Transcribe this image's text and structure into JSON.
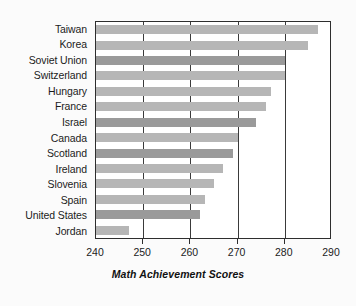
{
  "chart_data": {
    "type": "bar",
    "orientation": "horizontal",
    "title": "",
    "xlabel": "Math Achievement Scores",
    "ylabel": "",
    "xlim": [
      240,
      290
    ],
    "xticks": [
      240,
      250,
      260,
      270,
      280,
      290
    ],
    "xticklabels": [
      "240",
      "250",
      "260",
      "270",
      "280",
      "290"
    ],
    "grid": "vertical",
    "legend": "none",
    "categories": [
      "Taiwan",
      "Korea",
      "Soviet Union",
      "Switzerland",
      "Hungary",
      "France",
      "Israel",
      "Canada",
      "Scotland",
      "Ireland",
      "Slovenia",
      "Spain",
      "United States",
      "Jordan"
    ],
    "values": [
      287,
      285,
      280,
      280,
      277,
      276,
      274,
      270,
      269,
      267,
      265,
      263,
      262,
      247
    ],
    "bars": [
      {
        "category": "Taiwan",
        "value": 287,
        "shade": "light"
      },
      {
        "category": "Korea",
        "value": 285,
        "shade": "light"
      },
      {
        "category": "Soviet Union",
        "value": 280,
        "shade": "dark"
      },
      {
        "category": "Switzerland",
        "value": 280,
        "shade": "light"
      },
      {
        "category": "Hungary",
        "value": 277,
        "shade": "light"
      },
      {
        "category": "France",
        "value": 276,
        "shade": "light"
      },
      {
        "category": "Israel",
        "value": 274,
        "shade": "dark"
      },
      {
        "category": "Canada",
        "value": 270,
        "shade": "light"
      },
      {
        "category": "Scotland",
        "value": 269,
        "shade": "dark"
      },
      {
        "category": "Ireland",
        "value": 267,
        "shade": "light"
      },
      {
        "category": "Slovenia",
        "value": 265,
        "shade": "light"
      },
      {
        "category": "Spain",
        "value": 263,
        "shade": "light"
      },
      {
        "category": "United States",
        "value": 262,
        "shade": "dark"
      },
      {
        "category": "Jordan",
        "value": 247,
        "shade": "light"
      }
    ],
    "colors": {
      "bar_light": "#b6b6b6",
      "bar_dark": "#9a9a9a",
      "axis": "#2e2e2e",
      "grid": "#3a3a3a",
      "text": "#1b1b1b",
      "plot_background": "#ffffff",
      "figure_background": "#fbfbfb"
    }
  }
}
